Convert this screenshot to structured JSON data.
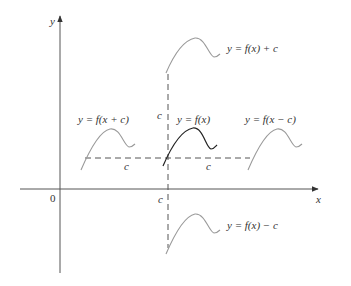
{
  "diagram": {
    "axes": {
      "x_label": "x",
      "y_label": "y",
      "origin_label": "0"
    },
    "shift_labels": {
      "c_vertical_upper": "c",
      "c_vertical_lower": "c",
      "c_horizontal_left": "c",
      "c_horizontal_right": "c"
    },
    "curves": [
      {
        "id": "f-x",
        "label": "y = f(x)",
        "color": "#222222"
      },
      {
        "id": "f-x-plus-c-arg",
        "label": "y = f(x + c)",
        "color": "#9a9a9a"
      },
      {
        "id": "f-x-minus-c-arg",
        "label": "y = f(x − c)",
        "color": "#9a9a9a"
      },
      {
        "id": "f-x-plus-c",
        "label": "y = f(x) + c",
        "color": "#9a9a9a"
      },
      {
        "id": "f-x-minus-c",
        "label": "y = f(x) − c",
        "color": "#9a9a9a"
      }
    ]
  }
}
